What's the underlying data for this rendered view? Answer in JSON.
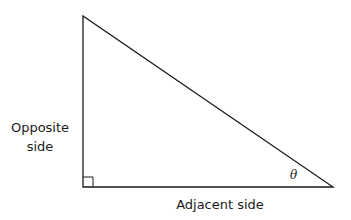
{
  "diagram": {
    "labels": {
      "opposite": "Opposite side",
      "adjacent": "Adjacent side",
      "angle": "θ"
    },
    "vertices": {
      "top": [
        83,
        16
      ],
      "right_angle": [
        83,
        187
      ],
      "angle_theta": [
        333,
        187
      ]
    },
    "right_angle_marker_size": 10,
    "stroke_color": "#1a1a1a"
  }
}
